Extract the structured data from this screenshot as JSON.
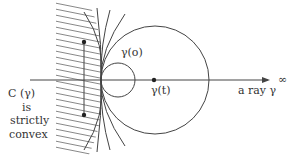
{
  "labels": {
    "c_gamma": "C (γ)",
    "is": "is",
    "strictly": "strictly",
    "convex": "convex",
    "gamma_o": "γ(o)",
    "gamma_t": "γ(t)",
    "a_ray": "a ray γ",
    "infinity": "∞"
  },
  "colors": {
    "stroke": "#444444",
    "background": "#ffffff"
  }
}
